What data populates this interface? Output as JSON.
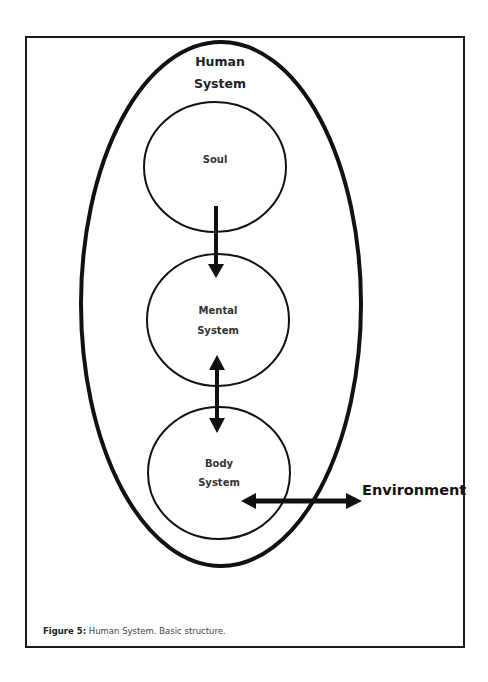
{
  "diagram": {
    "title_line1": "Human",
    "title_line2": "System",
    "nodes": [
      {
        "id": "soul",
        "line1": "Soul",
        "line2": ""
      },
      {
        "id": "mental",
        "line1": "Mental",
        "line2": "System"
      },
      {
        "id": "body",
        "line1": "Body",
        "line2": "System"
      }
    ],
    "external": "Environment",
    "edges": [
      {
        "from": "Soul",
        "to": "Mental System",
        "type": "one-way"
      },
      {
        "from": "Mental System",
        "to": "Body System",
        "type": "two-way"
      },
      {
        "from": "Body System",
        "to": "Environment",
        "type": "two-way"
      }
    ],
    "colors": {
      "stroke": "#111111",
      "background": "#ffffff"
    }
  },
  "caption": {
    "label": "Figure 5:",
    "text": " Human System.  Basic structure."
  }
}
